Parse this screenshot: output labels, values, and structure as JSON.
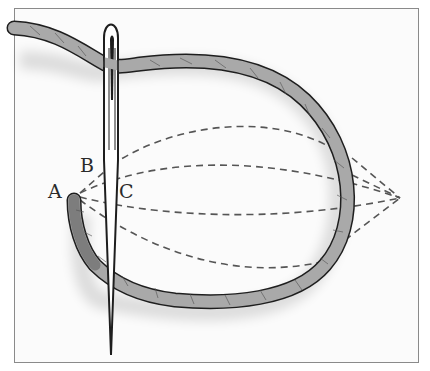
{
  "figure": {
    "labels": [
      {
        "id": "A",
        "text": "A"
      },
      {
        "id": "B",
        "text": "B"
      },
      {
        "id": "C",
        "text": "C"
      }
    ]
  },
  "colors": {
    "thread_fill": "#a9a9a9",
    "thread_dark": "#7d7d7d",
    "outline": "#1e1e1e",
    "dashed": "#555555",
    "frame": "#8a8a8a",
    "background": "#fbfbfb"
  }
}
